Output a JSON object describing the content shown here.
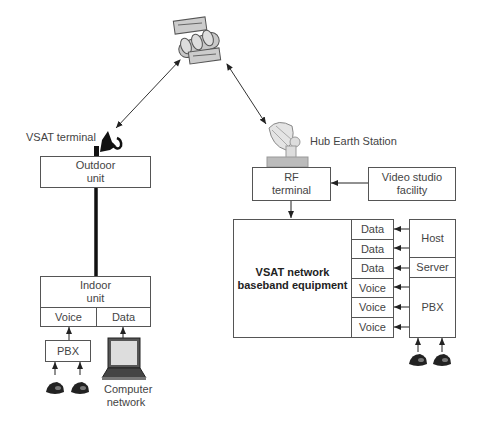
{
  "diagram": {
    "type": "VSAT network architecture",
    "satellite": {
      "icon": "satellite-icon"
    },
    "vsat_side": {
      "terminal_label": "VSAT terminal",
      "outdoor_unit": "Outdoor\nunit",
      "indoor_unit": "Indoor\nunit",
      "indoor_ports": [
        "Voice",
        "Data"
      ],
      "pbx": "PBX",
      "computer_label": "Computer\nnetwork",
      "phones": 2
    },
    "hub_side": {
      "station_label": "Hub Earth Station",
      "rf_terminal": "RF\nterminal",
      "video_studio": "Video studio\nfacility",
      "baseband": "VSAT network\nbaseband equipment",
      "ports": [
        "Data",
        "Data",
        "Data",
        "Voice",
        "Voice",
        "Voice"
      ],
      "host": "Host",
      "server": "Server",
      "pbx": "PBX",
      "phones": 2
    },
    "links": [
      {
        "from": "satellite",
        "to": "VSAT terminal",
        "type": "bidirectional"
      },
      {
        "from": "satellite",
        "to": "Hub Earth Station",
        "type": "bidirectional"
      },
      {
        "from": "Outdoor unit",
        "to": "Indoor unit",
        "type": "cable"
      },
      {
        "from": "Video studio facility",
        "to": "RF terminal",
        "type": "arrow"
      },
      {
        "from": "RF terminal",
        "to": "VSAT network baseband equipment",
        "type": "arrow"
      },
      {
        "from": "PBX",
        "to": "Voice",
        "type": "arrow"
      },
      {
        "from": "Computer network",
        "to": "Data",
        "type": "arrow"
      },
      {
        "from": "Host",
        "to": "Data",
        "type": "arrow"
      },
      {
        "from": "Server",
        "to": "Data",
        "type": "arrow"
      },
      {
        "from": "PBX",
        "to": "Voice",
        "type": "arrow"
      }
    ]
  },
  "colors": {
    "line": "#333333",
    "box_border": "#555555",
    "icon_fill": "#cccccc"
  }
}
